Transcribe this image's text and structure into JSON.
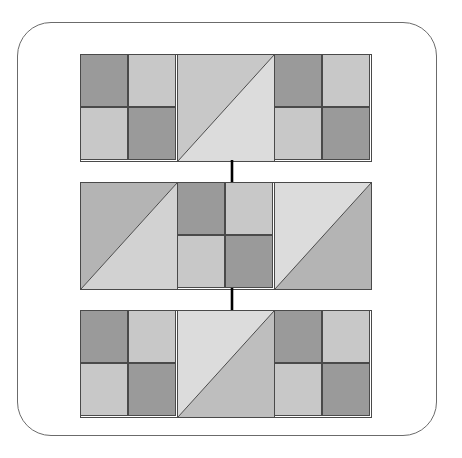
{
  "figure": {
    "background_color": "#ffffff",
    "frame": {
      "shape": "rounded-rectangle",
      "stroke_color": "#6b6b6b",
      "stroke_width": 1,
      "corner_radius": 34
    },
    "palette": {
      "dark_gray": "#9a9a9a",
      "medium_gray": "#b4b4b4",
      "light_gray": "#c8c8c8",
      "pale_gray": "#dcdcdc",
      "outline": "#4a4a4a",
      "arrow": "#000000"
    },
    "rows": [
      {
        "name": "row-1",
        "label": "Row 1",
        "blocks": [
          {
            "name": "block-1-1",
            "label": "Checkerboard tile",
            "kind": "checker",
            "quads": {
              "tl": "#9a9a9a",
              "tr": "#c8c8c8",
              "bl": "#c8c8c8",
              "br": "#9a9a9a"
            }
          },
          {
            "name": "block-1-2",
            "label": "Diagonal tile",
            "kind": "diagonal",
            "diagonal": "bottom-left-to-top-right",
            "upper": "#c8c8c8",
            "lower": "#dcdcdc"
          },
          {
            "name": "block-1-3",
            "label": "Checkerboard tile",
            "kind": "checker",
            "quads": {
              "tl": "#9a9a9a",
              "tr": "#c8c8c8",
              "bl": "#c8c8c8",
              "br": "#9a9a9a"
            }
          }
        ]
      },
      {
        "name": "row-2",
        "label": "Row 2",
        "blocks": [
          {
            "name": "block-2-1",
            "label": "Diagonal tile",
            "kind": "diagonal",
            "diagonal": "bottom-left-to-top-right",
            "upper": "#b4b4b4",
            "lower": "#d2d2d2"
          },
          {
            "name": "block-2-2",
            "label": "Checkerboard tile",
            "kind": "checker",
            "quads": {
              "tl": "#9a9a9a",
              "tr": "#c8c8c8",
              "bl": "#c8c8c8",
              "br": "#9a9a9a"
            }
          },
          {
            "name": "block-2-3",
            "label": "Diagonal tile",
            "kind": "diagonal",
            "diagonal": "bottom-left-to-top-right",
            "upper": "#dcdcdc",
            "lower": "#b4b4b4"
          }
        ]
      },
      {
        "name": "row-3",
        "label": "Row 3",
        "blocks": [
          {
            "name": "block-3-1",
            "label": "Checkerboard tile",
            "kind": "checker",
            "quads": {
              "tl": "#9a9a9a",
              "tr": "#c8c8c8",
              "bl": "#c8c8c8",
              "br": "#9a9a9a"
            }
          },
          {
            "name": "block-3-2",
            "label": "Diagonal tile",
            "kind": "diagonal",
            "diagonal": "bottom-left-to-top-right",
            "upper": "#dcdcdc",
            "lower": "#bebebe"
          },
          {
            "name": "block-3-3",
            "label": "Checkerboard tile",
            "kind": "checker",
            "quads": {
              "tl": "#9a9a9a",
              "tr": "#c8c8c8",
              "bl": "#c8c8c8",
              "br": "#9a9a9a"
            }
          }
        ]
      }
    ],
    "arrows": [
      {
        "name": "arrow-row1-to-row2",
        "direction": "down",
        "from": "row-1",
        "to": "row-2"
      },
      {
        "name": "arrow-row2-to-row3",
        "direction": "down",
        "from": "row-2",
        "to": "row-3"
      }
    ]
  }
}
